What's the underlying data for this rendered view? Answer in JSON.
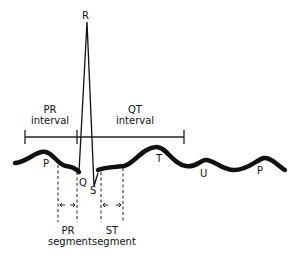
{
  "diagram": {
    "waves": {
      "p1": "P",
      "q": "Q",
      "r": "R",
      "s": "S",
      "t": "T",
      "u": "U",
      "p2": "P"
    },
    "intervals": {
      "pr": {
        "line1": "PR",
        "line2": "interval"
      },
      "qt": {
        "line1": "QT",
        "line2": "interval"
      }
    },
    "segments": {
      "pr": {
        "line1": "PR",
        "line2": "segment"
      },
      "st": {
        "line1": "ST",
        "line2": "segment"
      }
    },
    "colors": {
      "line": "#111111",
      "background": "#ffffff"
    }
  }
}
